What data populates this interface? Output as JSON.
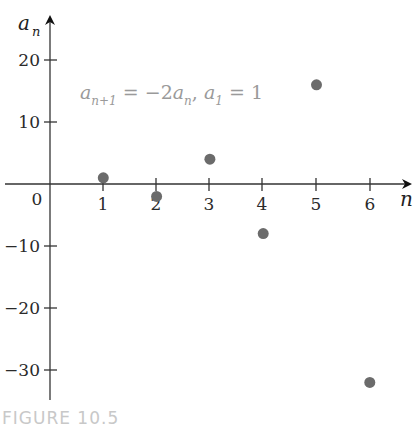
{
  "chart_data": {
    "type": "scatter",
    "title": "",
    "annotation": {
      "text": "a_{n+1} = -2a_n, a_1 = 1",
      "parts": {
        "a1": "a",
        "sub1": "n+1",
        "eq1": " = −2",
        "a2": "a",
        "sub2": "n",
        "comma": ", ",
        "a3": "a",
        "sub3": "1",
        "eq2": " = 1"
      }
    },
    "xlabel": "n",
    "ylabel": {
      "base": "a",
      "sub": "n"
    },
    "x": [
      1,
      2,
      3,
      4,
      5,
      6
    ],
    "values": [
      1,
      -2,
      4,
      -8,
      16,
      -32
    ],
    "x_ticks": [
      "1",
      "2",
      "3",
      "4",
      "5",
      "6"
    ],
    "y_ticks": [
      "20",
      "10",
      "−10",
      "−20",
      "−30"
    ],
    "origin_label": "0",
    "xlim": [
      0,
      6.8
    ],
    "ylim": [
      -35,
      23
    ],
    "grid": false,
    "legend": "none",
    "marker_color": "#6b6b6b"
  },
  "caption": "FIGURE 10.5"
}
